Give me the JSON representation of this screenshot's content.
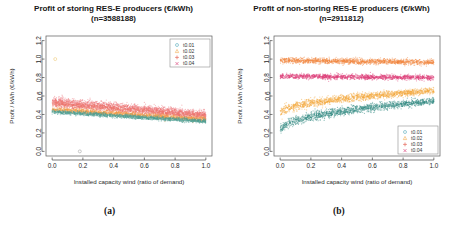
{
  "figure": {
    "caption_a": "(a)",
    "caption_b": "(b)"
  },
  "panels": [
    {
      "id": "storing",
      "title_line1": "Profit of storing RES-E producers (€/kWh)",
      "title_line2": "(n=3588188)",
      "xlabel": "Installed capacity wind (ratio of demand)",
      "ylabel": "Profit / kWh (€/kWh)",
      "legend_position": "top-right"
    },
    {
      "id": "non-storing",
      "title_line1": "Profit of non-storing RES-E producers (€/kWh)",
      "title_line2": "(n=2911812)",
      "xlabel": "Installed capacity wind (ratio of demand)",
      "ylabel": "Profit / kWh (€/kWh)",
      "legend_position": "bottom-right"
    }
  ],
  "chart_data": [
    {
      "type": "scatter",
      "panel": "a",
      "title": "Profit of storing RES-E producers (€/kWh)",
      "subtitle": "(n=3588188)",
      "xlabel": "Installed capacity wind (ratio of demand)",
      "ylabel": "Profit / kWh (€/kWh)",
      "xlim": [
        -0.04,
        1.04
      ],
      "ylim": [
        -0.05,
        1.25
      ],
      "xticks": [
        "0.0",
        "0.2",
        "0.4",
        "0.6",
        "0.8",
        "1.0"
      ],
      "yticks": [
        "0.0",
        "0.2",
        "0.4",
        "0.6",
        "0.8",
        "1.0",
        "1.2"
      ],
      "grid": false,
      "legend": [
        {
          "label": "t0.01",
          "symbol": "circle",
          "color": "#6fb7c4"
        },
        {
          "label": "t0.02",
          "symbol": "triangle",
          "color": "#f3b96b"
        },
        {
          "label": "t0.03",
          "symbol": "plus",
          "color": "#e8766b"
        },
        {
          "label": "t0.04",
          "symbol": "cross",
          "color": "#e05f8e"
        }
      ],
      "series": [
        {
          "name": "t0.04",
          "color": "#ef7f88",
          "y_start": 0.545,
          "y_end": 0.4,
          "spread": 0.055
        },
        {
          "name": "t0.03",
          "color": "#f0756c",
          "y_start": 0.52,
          "y_end": 0.38,
          "spread": 0.05
        },
        {
          "name": "t0.02",
          "color": "#f5a04a",
          "y_start": 0.455,
          "y_end": 0.345,
          "spread": 0.03
        },
        {
          "name": "t0.01",
          "color": "#52a296",
          "y_start": 0.43,
          "y_end": 0.325,
          "spread": 0.026
        }
      ],
      "outliers": [
        {
          "x": 0.02,
          "y": 1.0,
          "color": "#f2d79a"
        },
        {
          "x": 0.18,
          "y": 0.0,
          "color": "#b9b9b9"
        }
      ]
    },
    {
      "type": "scatter",
      "panel": "b",
      "title": "Profit of non-storing RES-E producers (€/kWh)",
      "subtitle": "(n=2911812)",
      "xlabel": "Installed capacity wind (ratio of demand)",
      "ylabel": "Profit / kWh (€/kWh)",
      "xlim": [
        -0.04,
        1.04
      ],
      "ylim": [
        -0.05,
        1.25
      ],
      "xticks": [
        "0.0",
        "0.2",
        "0.4",
        "0.6",
        "0.8",
        "1.0"
      ],
      "yticks": [
        "0.0",
        "0.2",
        "0.4",
        "0.6",
        "0.8",
        "1.0",
        "1.2"
      ],
      "grid": false,
      "legend": [
        {
          "label": "t0.01",
          "symbol": "circle",
          "color": "#6fb7c4"
        },
        {
          "label": "t0.02",
          "symbol": "triangle",
          "color": "#f3b96b"
        },
        {
          "label": "t0.03",
          "symbol": "plus",
          "color": "#e8766b"
        },
        {
          "label": "t0.04",
          "symbol": "cross",
          "color": "#e05f8e"
        }
      ],
      "series": [
        {
          "name": "t0.04-flat",
          "color": "#f4883f",
          "y_start": 0.985,
          "y_end": 0.965,
          "spread": 0.035
        },
        {
          "name": "t0.03-flat",
          "color": "#e0417c",
          "y_start": 0.815,
          "y_end": 0.8,
          "spread": 0.032
        },
        {
          "name": "t0.02-rise",
          "color": "#f5a93c",
          "y_start": 0.4,
          "y_end": 0.655,
          "spread": 0.045
        },
        {
          "name": "t0.01-rise",
          "color": "#2f8a82",
          "y_start": 0.215,
          "y_end": 0.545,
          "spread": 0.048
        }
      ],
      "outliers": []
    }
  ]
}
